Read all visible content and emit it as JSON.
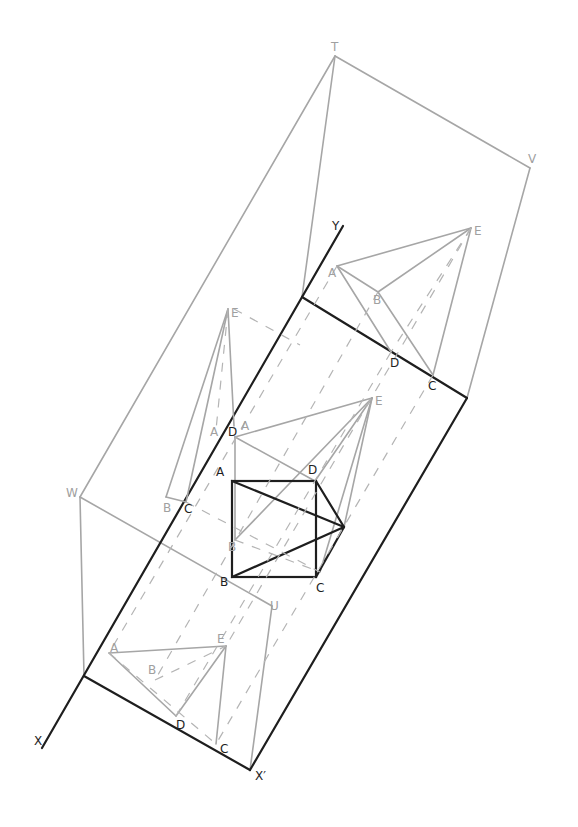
{
  "diagram": {
    "type": "orthographic projection with auxiliary views",
    "colors": {
      "construction": "#a6a6a6",
      "main": "#1e1e1e",
      "background": "#ffffff"
    },
    "reference_lines": {
      "xy_line": {
        "start_label": "X",
        "end_label": "Y"
      },
      "x_prime": {
        "label": "X′"
      }
    },
    "frame_points": {
      "T": "T",
      "V": "V",
      "W": "W",
      "U": "U"
    },
    "plan_view": {
      "A": "A",
      "B": "B",
      "C": "C",
      "D": "D"
    },
    "elevation_view": {
      "A": "A",
      "B": "B",
      "D": "D",
      "E": "E"
    },
    "upper_right_view": {
      "A": "A",
      "B": "B",
      "C": "C",
      "D": "D",
      "E": "E"
    },
    "left_side_view": {
      "E": "E",
      "A1": "A",
      "A2": "A",
      "B": "B",
      "C": "C",
      "D": "D"
    },
    "lower_view": {
      "A": "A",
      "B": "B",
      "C": "C",
      "D": "D",
      "E": "E"
    }
  }
}
